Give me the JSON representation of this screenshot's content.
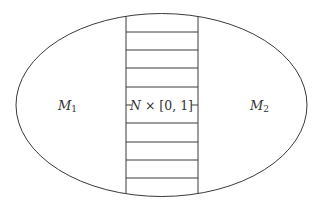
{
  "diagram": {
    "type": "connected-sum-neck",
    "colors": {
      "stroke": "#3a3a3a",
      "text": "#333333",
      "background": "#ffffff"
    },
    "ellipse": {
      "cx": 161.5,
      "cy": 105,
      "rx": 145.5,
      "ry": 91.5
    },
    "neck": {
      "x_left": 126,
      "x_right": 198,
      "rungs_y": [
        32,
        50,
        68,
        87,
        123,
        142,
        160,
        178
      ]
    },
    "labels": {
      "left_manifold": {
        "base": "M",
        "sub": "1"
      },
      "right_manifold": {
        "base": "M",
        "sub": "2"
      },
      "neck_label": {
        "var": "N",
        "rest": " × [0, 1]"
      }
    }
  }
}
